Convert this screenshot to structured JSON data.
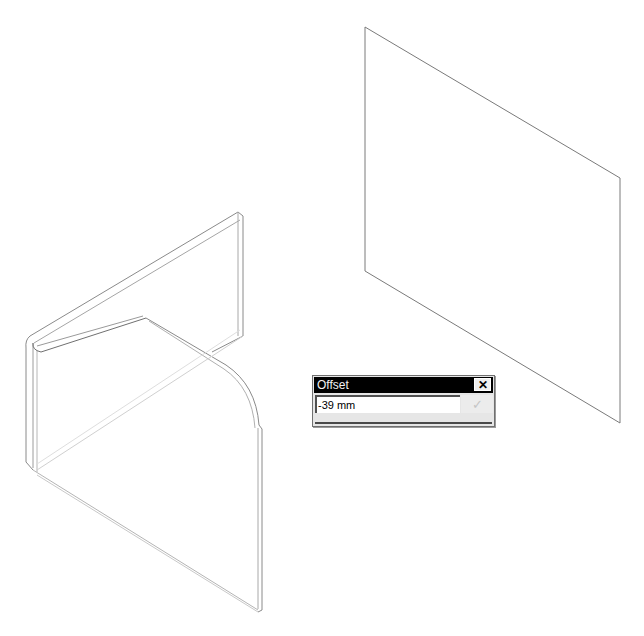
{
  "scene": {
    "background": "#ffffff",
    "line_color": "#6e6e6e",
    "objects": [
      {
        "name": "sheet-metal-part",
        "description": "bent sheet metal bracket with rounded corner flange"
      },
      {
        "name": "reference-plane",
        "description": "rectangular offset plane in isometric view"
      }
    ]
  },
  "offset_dialog": {
    "title": "Offset",
    "value": "-39 mm",
    "close_icon": "close-icon",
    "confirm_icon": "checkmark-icon",
    "confirm_label": "✓",
    "close_label": "✕",
    "confirm_enabled": false
  }
}
